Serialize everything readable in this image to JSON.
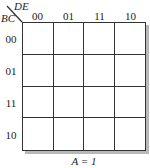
{
  "kmap": {
    "col_var": "DE",
    "row_var": "BC",
    "columns": [
      "00",
      "01",
      "11",
      "10"
    ],
    "rows": [
      "00",
      "01",
      "11",
      "10"
    ],
    "cells": [
      [
        "",
        "",
        "",
        ""
      ],
      [
        "",
        "",
        "",
        ""
      ],
      [
        "",
        "",
        "",
        ""
      ],
      [
        "",
        "",
        "",
        ""
      ]
    ],
    "caption": "A = 1"
  }
}
